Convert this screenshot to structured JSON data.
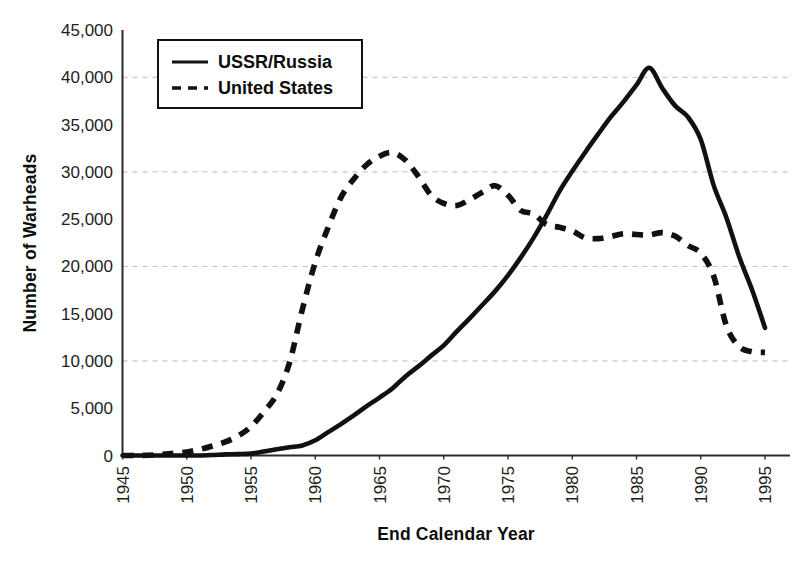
{
  "chart_data": {
    "type": "line",
    "title": "",
    "xlabel": "End Calendar Year",
    "ylabel": "Number of Warheads",
    "xlim": [
      1945,
      1995
    ],
    "ylim": [
      0,
      45000
    ],
    "grid": true,
    "grid_values": [
      10000,
      20000,
      30000,
      40000
    ],
    "legend_position": "top-left",
    "x_ticks": [
      "1945",
      "1950",
      "1955",
      "1960",
      "1965",
      "1970",
      "1975",
      "1980",
      "1985",
      "1990",
      "1995"
    ],
    "y_ticks": [
      "0",
      "5,000",
      "10,000",
      "15,000",
      "20,000",
      "25,000",
      "30,000",
      "35,000",
      "40,000",
      "45,000"
    ],
    "x": [
      1945,
      1946,
      1947,
      1948,
      1949,
      1950,
      1951,
      1952,
      1953,
      1954,
      1955,
      1956,
      1957,
      1958,
      1959,
      1960,
      1961,
      1962,
      1963,
      1964,
      1965,
      1966,
      1967,
      1968,
      1969,
      1970,
      1971,
      1972,
      1973,
      1974,
      1975,
      1976,
      1977,
      1978,
      1979,
      1980,
      1981,
      1982,
      1983,
      1984,
      1985,
      1986,
      1987,
      1988,
      1989,
      1990,
      1991,
      1992,
      1993,
      1994,
      1995
    ],
    "series": [
      {
        "name": "USSR/Russia",
        "style": "solid",
        "color": "#111111",
        "values": [
          0,
          0,
          0,
          0,
          0,
          0,
          0,
          50,
          120,
          150,
          200,
          426,
          660,
          869,
          1060,
          1605,
          2471,
          3322,
          4238,
          5221,
          6129,
          7089,
          8339,
          9399,
          10538,
          11643,
          13092,
          14478,
          15915,
          17385,
          19055,
          20955,
          23044,
          25393,
          27935,
          30062,
          32049,
          33952,
          35804,
          37431,
          39197,
          41000,
          38859,
          37000,
          35804,
          33417,
          28595,
          25155,
          21000,
          17500,
          13500
        ]
      },
      {
        "name": "United States",
        "style": "dashed",
        "color": "#111111",
        "values": [
          6,
          11,
          32,
          110,
          235,
          369,
          640,
          1005,
          1436,
          2063,
          3057,
          4618,
          6444,
          9822,
          15468,
          20434,
          24111,
          27297,
          29249,
          30751,
          31642,
          32040,
          31255,
          29561,
          27552,
          26662,
          26436,
          27052,
          27835,
          28537,
          27519,
          25914,
          25542,
          24418,
          24138,
          23764,
          23031,
          22937,
          23154,
          23458,
          23368,
          23317,
          23575,
          23205,
          22217,
          21392,
          19008,
          13708,
          11511,
          10979,
          10904
        ]
      }
    ],
    "legend": [
      {
        "label": "USSR/Russia",
        "style": "solid"
      },
      {
        "label": "United States",
        "style": "dashed"
      }
    ]
  }
}
